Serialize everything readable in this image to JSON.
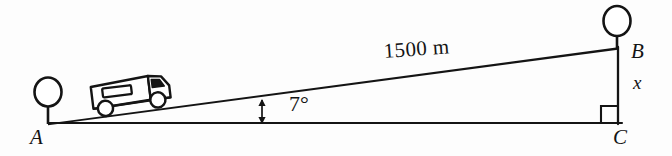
{
  "figure": {
    "background_color": "#fdfdfd",
    "ink_color": "#141414"
  },
  "labels": {
    "vertex_a": "A",
    "vertex_b": "B",
    "vertex_c": "C",
    "height_side": "x",
    "hypotenuse_length": "1500 m",
    "incline_angle": "7°"
  },
  "geometry": {
    "points": {
      "A": {
        "x": 48,
        "y": 123
      },
      "B": {
        "x": 618,
        "y": 48
      },
      "C": {
        "x": 618,
        "y": 123
      }
    },
    "right_angle_marker": {
      "at": "C",
      "size": 17
    },
    "angle_arrow": {
      "x": 262,
      "y_top": 101,
      "y_bottom": 122
    }
  },
  "markers": [
    {
      "name": "pole-marker-a",
      "circle_cx": 48,
      "circle_cy": 93,
      "circle_rx": 13,
      "circle_ry": 14,
      "stem_bottom_y": 123
    },
    {
      "name": "pole-marker-b",
      "circle_cx": 617,
      "circle_cy": 21,
      "circle_rx": 13,
      "circle_ry": 15,
      "stem_bottom_y": 48
    }
  ],
  "vehicle": {
    "name": "truck-on-incline",
    "center_x": 124,
    "center_y": 95,
    "rotation_deg": -7
  },
  "colors": {
    "line": "#141414",
    "fill": "#ffffff",
    "background": "#fdfdfd"
  }
}
